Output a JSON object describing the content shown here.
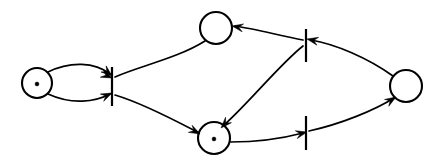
{
  "diagram": {
    "type": "petri-net",
    "canvas": {
      "width": 433,
      "height": 166,
      "background": "#ffffff"
    },
    "stroke_color": "#000000",
    "fill_color": "#ffffff",
    "places": [
      {
        "id": "p1",
        "name": "place-left",
        "cx": 37,
        "cy": 83,
        "r": 15,
        "tokens": 1,
        "token_positions": [
          {
            "x": 37,
            "y": 84,
            "r": 1.9
          }
        ]
      },
      {
        "id": "p2",
        "name": "place-top",
        "cx": 216,
        "cy": 28,
        "r": 16,
        "tokens": 0,
        "token_positions": []
      },
      {
        "id": "p3",
        "name": "place-bottom-center",
        "cx": 214,
        "cy": 138,
        "r": 16,
        "tokens": 1,
        "token_positions": [
          {
            "x": 214,
            "y": 139,
            "r": 1.9
          }
        ]
      },
      {
        "id": "p4",
        "name": "place-right",
        "cx": 406,
        "cy": 86,
        "r": 16,
        "tokens": 0,
        "token_positions": []
      }
    ],
    "transitions": [
      {
        "id": "t1",
        "name": "transition-left",
        "x": 112,
        "y1": 67,
        "y2": 106
      },
      {
        "id": "t2",
        "name": "transition-upper-right",
        "x": 306,
        "y1": 29,
        "y2": 62
      },
      {
        "id": "t3",
        "name": "transition-lower-right",
        "x": 306,
        "y1": 116,
        "y2": 150
      }
    ],
    "arcs": [
      {
        "id": "a1",
        "name": "arc-place-left-to-transition-left",
        "from": "p1",
        "to": "t1",
        "path": "M 48 72 C 70 61, 95 62, 110 74",
        "arrow": {
          "x": 112,
          "y": 76,
          "angle": 40
        }
      },
      {
        "id": "a2",
        "name": "arc-place-bottom-center-to-transition-left",
        "from": "p3",
        "to": "t1",
        "path": "M 48 94 C 72 105, 95 102, 110 94",
        "arrow": {
          "x": 112,
          "y": 93,
          "angle": -25
        }
      },
      {
        "id": "a3",
        "name": "arc-place-top-to-transition-left",
        "from": "p2",
        "to": "t1",
        "path": "M 205 41 C 178 58, 140 66, 115 77",
        "arrow": {
          "x": 112,
          "y": 78,
          "angle": 24
        }
      },
      {
        "id": "a4",
        "name": "arc-transition-left-to-place-bottom-center",
        "from": "t1",
        "to": "p3",
        "path": "M 115 95 C 145 104, 178 122, 199 133",
        "arrow": {
          "x": 200,
          "y": 134,
          "angle": 28
        }
      },
      {
        "id": "a5",
        "name": "arc-place-right-to-transition-upper-right",
        "from": "p4",
        "to": "t2",
        "path": "M 393 76 C 368 58, 335 44, 311 40",
        "arrow": {
          "x": 307,
          "y": 39,
          "angle": 192
        }
      },
      {
        "id": "a6",
        "name": "arc-transition-upper-right-to-place-top",
        "from": "t2",
        "to": "p2",
        "path": "M 303 40 C 281 36, 256 29, 235 26",
        "arrow": {
          "x": 232,
          "y": 26,
          "angle": 190
        }
      },
      {
        "id": "a7",
        "name": "arc-transition-upper-right-to-place-bottom-center",
        "from": "t2",
        "to": "p3",
        "path": "M 303 46 C 280 64, 248 104, 223 126",
        "arrow": {
          "x": 221,
          "y": 128,
          "angle": 133
        }
      },
      {
        "id": "a8",
        "name": "arc-place-bottom-center-to-transition-lower-right",
        "from": "p3",
        "to": "t3",
        "path": "M 230 142 C 260 142, 288 137, 303 133",
        "arrow": {
          "x": 307,
          "y": 132,
          "angle": -14
        }
      },
      {
        "id": "a9",
        "name": "arc-transition-lower-right-to-place-right",
        "from": "t3",
        "to": "p4",
        "path": "M 309 131 C 341 124, 375 110, 394 98",
        "arrow": {
          "x": 396,
          "y": 97,
          "angle": -32
        }
      }
    ]
  }
}
